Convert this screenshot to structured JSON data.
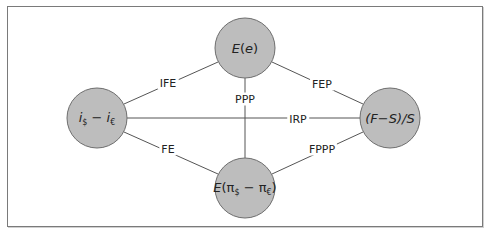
{
  "diagram": {
    "nodes": [
      {
        "id": "expected_exchange",
        "label": "E(e)",
        "cx": 245,
        "cy": 48
      },
      {
        "id": "interest_diff",
        "label": "i$ − i€",
        "cx": 97,
        "cy": 118
      },
      {
        "id": "forward_premium",
        "label": "(F−S)/S",
        "cx": 390,
        "cy": 118
      },
      {
        "id": "inflation_diff",
        "label": "E(π$ − π€)",
        "cx": 245,
        "cy": 188
      }
    ],
    "edges": [
      {
        "from": "interest_diff",
        "to": "expected_exchange",
        "label": "IFE"
      },
      {
        "from": "expected_exchange",
        "to": "forward_premium",
        "label": "FEP"
      },
      {
        "from": "expected_exchange",
        "to": "inflation_diff",
        "label": "PPP"
      },
      {
        "from": "interest_diff",
        "to": "forward_premium",
        "label": "IRP"
      },
      {
        "from": "interest_diff",
        "to": "inflation_diff",
        "label": "FE"
      },
      {
        "from": "inflation_diff",
        "to": "forward_premium",
        "label": "FPPP"
      }
    ],
    "node_radius": 30,
    "colors": {
      "node_fill": "#bdbdbd",
      "node_stroke": "#6e6e6e",
      "edge": "#555555",
      "border": "#7a7a7a"
    }
  },
  "labels": {
    "node_ee": {
      "E": "E",
      "open": "(",
      "e": "e",
      "close": ")"
    },
    "node_left": {
      "i1": "i",
      "s1": "$",
      "minus": " − ",
      "i2": "i",
      "s2": "€"
    },
    "node_right": {
      "text": "(F−S)/S"
    },
    "node_bottom": {
      "E": "E",
      "open": "(",
      "pi1": "π",
      "s1": "$",
      "minus": " − ",
      "pi2": "π",
      "s2": "€",
      "close": ")"
    },
    "edge_ife": "IFE",
    "edge_fep": "FEP",
    "edge_ppp": "PPP",
    "edge_irp": "IRP",
    "edge_fe": "FE",
    "edge_fppp": "FPPP"
  }
}
